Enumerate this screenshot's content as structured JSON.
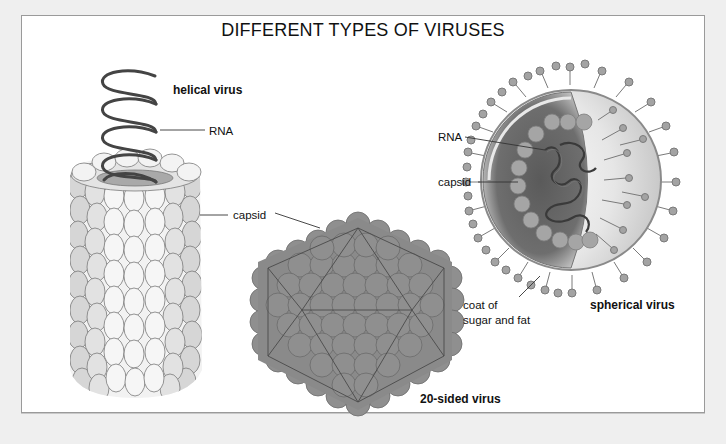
{
  "diagram": {
    "title": "DIFFERENT TYPES OF VIRUSES",
    "viruses": [
      {
        "name": "helical virus",
        "shape": "helix-coil-over-cylinder",
        "labels": [
          "RNA",
          "capsid"
        ]
      },
      {
        "name": "20-sided virus",
        "shape": "icosahedron-of-spheres",
        "labels": [
          "capsid"
        ]
      },
      {
        "name": "spherical virus",
        "shape": "cutaway-sphere-with-spikes",
        "labels": [
          "RNA",
          "capsid",
          "coat of sugar and fat"
        ]
      }
    ],
    "labels": {
      "helical_title": "helical virus",
      "helical_rna": "RNA",
      "helical_capsid": "capsid",
      "icosa_title": "20-sided virus",
      "sphere_rna": "RNA",
      "sphere_capsid": "capsid",
      "sphere_coat_line1": "coat of",
      "sphere_coat_line2": "sugar and fat",
      "sphere_title": "spherical virus"
    },
    "colors": {
      "background": "#efefef",
      "panel": "#ffffff",
      "panel_border": "#9a9a9a",
      "helix_coil": "#444444",
      "capsid_light": "#eeeeee",
      "capsid_mid": "#d4d4d4",
      "icosa_fill": "#8f8f8f",
      "sphere_dark": "#555555",
      "sphere_spike": "#a3a3a3"
    }
  }
}
